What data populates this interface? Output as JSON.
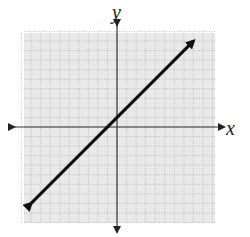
{
  "chart_data": {
    "type": "line",
    "title": "",
    "xlabel": "x",
    "ylabel": "y",
    "xlim": [
      -10,
      10
    ],
    "ylim": [
      -10,
      10
    ],
    "grid": true,
    "grid_step": 1,
    "axes_arrows": true,
    "series": [
      {
        "name": "line",
        "equation": "y = x + 1",
        "x": [
          -9,
          8
        ],
        "y": [
          -8,
          9
        ],
        "arrows_both_ends": true
      }
    ]
  },
  "labels": {
    "x": "x",
    "y": "y"
  },
  "colors": {
    "grid_bg": "#e9e9e9",
    "grid_line": "#9a9a9a",
    "axis": "#333333",
    "line": "#111111"
  }
}
